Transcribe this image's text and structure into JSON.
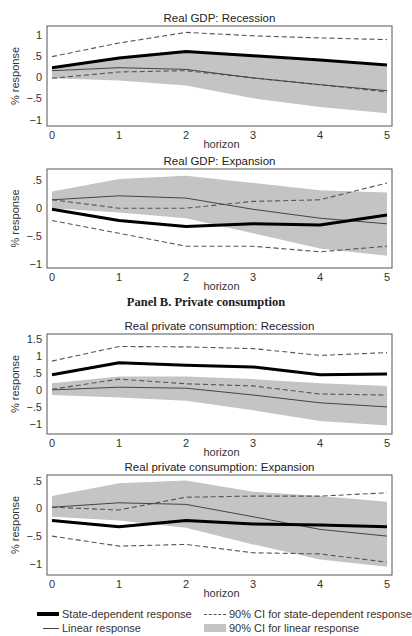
{
  "panels": {
    "a_title": "Panel A. Real GDP",
    "b_title": "Panel B. Private consumption"
  },
  "legend": {
    "state": "State-dependent response",
    "linear": "Linear response",
    "ci_state": "90% CI for state-dependent response",
    "ci_linear": "90% CI for linear response"
  },
  "colors": {
    "state_line": "#000000",
    "linear_line": "#444444",
    "ci_state_line": "#555555",
    "ci_linear_band": "#c4c4c4",
    "frame": "#555555"
  },
  "chart_data": [
    {
      "type": "line",
      "title": "Real GDP: Recession",
      "xlabel": "horizon",
      "ylabel": "% response",
      "x": [
        0,
        1,
        2,
        3,
        4,
        5
      ],
      "yticks": [
        1,
        0.5,
        0,
        -0.5,
        -1
      ],
      "ytick_labels": [
        "1",
        ".5",
        "0",
        "−.5",
        "−1"
      ],
      "ylim": [
        -1.15,
        1.2
      ],
      "series": [
        {
          "name": "State-dependent response",
          "values": [
            0.22,
            0.45,
            0.6,
            0.5,
            0.4,
            0.28
          ]
        },
        {
          "name": "Linear response",
          "values": [
            0.15,
            0.22,
            0.18,
            -0.02,
            -0.18,
            -0.32
          ]
        },
        {
          "name": "90% CI for state-dependent response (upper)",
          "values": [
            0.48,
            0.8,
            1.05,
            0.97,
            0.92,
            0.88
          ]
        },
        {
          "name": "90% CI for state-dependent response (lower)",
          "values": [
            -0.03,
            0.12,
            0.15,
            -0.02,
            -0.18,
            -0.35
          ]
        },
        {
          "name": "90% CI for linear response (upper)",
          "values": [
            0.25,
            0.45,
            0.58,
            0.48,
            0.38,
            0.25
          ]
        },
        {
          "name": "90% CI for linear response (lower)",
          "values": [
            -0.03,
            -0.08,
            -0.2,
            -0.5,
            -0.7,
            -0.85
          ]
        }
      ]
    },
    {
      "type": "line",
      "title": "Real GDP: Expansion",
      "xlabel": "horizon",
      "ylabel": "% response",
      "x": [
        0,
        1,
        2,
        3,
        4,
        5
      ],
      "yticks": [
        0.5,
        0,
        -0.5,
        -1
      ],
      "ytick_labels": [
        ".5",
        "0",
        "−.5",
        "−1"
      ],
      "ylim": [
        -1.07,
        0.7
      ],
      "series": [
        {
          "name": "State-dependent response",
          "values": [
            -0.02,
            -0.22,
            -0.33,
            -0.28,
            -0.3,
            -0.12
          ]
        },
        {
          "name": "Linear response",
          "values": [
            0.15,
            0.22,
            0.18,
            -0.02,
            -0.18,
            -0.28
          ]
        },
        {
          "name": "90% CI for state-dependent response (upper)",
          "values": [
            0.15,
            0.0,
            0.0,
            0.12,
            0.15,
            0.45
          ]
        },
        {
          "name": "90% CI for state-dependent response (lower)",
          "values": [
            -0.22,
            -0.45,
            -0.68,
            -0.68,
            -0.78,
            -0.68
          ]
        },
        {
          "name": "90% CI for linear response (upper)",
          "values": [
            0.3,
            0.52,
            0.58,
            0.45,
            0.32,
            0.28
          ]
        },
        {
          "name": "90% CI for linear response (lower)",
          "values": [
            0.0,
            -0.08,
            -0.18,
            -0.45,
            -0.72,
            -0.85
          ]
        }
      ]
    },
    {
      "type": "line",
      "title": "Real private consumption: Recession",
      "xlabel": "horizon",
      "ylabel": "% response",
      "x": [
        0,
        1,
        2,
        3,
        4,
        5
      ],
      "yticks": [
        1.5,
        1,
        0.5,
        0,
        -0.5,
        -1
      ],
      "ytick_labels": [
        "1.5",
        "1",
        ".5",
        "0",
        "−.5",
        "−1"
      ],
      "ylim": [
        -1.3,
        1.65
      ],
      "series": [
        {
          "name": "State-dependent response",
          "values": [
            0.45,
            0.8,
            0.73,
            0.68,
            0.45,
            0.47
          ]
        },
        {
          "name": "Linear response",
          "values": [
            0.0,
            0.08,
            0.05,
            -0.15,
            -0.38,
            -0.5
          ]
        },
        {
          "name": "90% CI for state-dependent response (upper)",
          "values": [
            0.85,
            1.28,
            1.27,
            1.22,
            1.02,
            1.1
          ]
        },
        {
          "name": "90% CI for state-dependent response (lower)",
          "values": [
            0.02,
            0.32,
            0.18,
            0.12,
            -0.12,
            -0.15
          ]
        },
        {
          "name": "90% CI for linear response (upper)",
          "values": [
            0.2,
            0.4,
            0.4,
            0.32,
            0.2,
            0.12
          ]
        },
        {
          "name": "90% CI for linear response (lower)",
          "values": [
            -0.15,
            -0.22,
            -0.32,
            -0.6,
            -0.92,
            -1.05
          ]
        }
      ]
    },
    {
      "type": "line",
      "title": "Real private consumption: Expansion",
      "xlabel": "horizon",
      "ylabel": "% response",
      "x": [
        0,
        1,
        2,
        3,
        4,
        5
      ],
      "yticks": [
        0.5,
        0,
        -0.5,
        -1
      ],
      "ytick_labels": [
        ".5",
        "0",
        "−.5",
        "−1"
      ],
      "ylim": [
        -1.2,
        0.6
      ],
      "series": [
        {
          "name": "State-dependent response",
          "values": [
            -0.22,
            -0.33,
            -0.22,
            -0.28,
            -0.3,
            -0.33
          ]
        },
        {
          "name": "Linear response",
          "values": [
            0.02,
            0.1,
            0.07,
            -0.15,
            -0.38,
            -0.5
          ]
        },
        {
          "name": "90% CI for state-dependent response (upper)",
          "values": [
            0.02,
            -0.03,
            0.2,
            0.22,
            0.22,
            0.28
          ]
        },
        {
          "name": "90% CI for state-dependent response (lower)",
          "values": [
            -0.5,
            -0.68,
            -0.65,
            -0.8,
            -0.82,
            -0.97
          ]
        },
        {
          "name": "90% CI for linear response (upper)",
          "values": [
            0.22,
            0.45,
            0.5,
            0.3,
            0.22,
            0.12
          ]
        },
        {
          "name": "90% CI for linear response (lower)",
          "values": [
            -0.15,
            -0.22,
            -0.35,
            -0.65,
            -0.92,
            -1.05
          ]
        }
      ]
    }
  ]
}
